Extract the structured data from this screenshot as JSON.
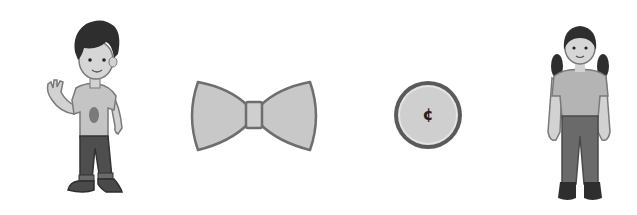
{
  "scene": {
    "background": "#ffffff",
    "items": [
      {
        "name": "boy",
        "description": "boy waving, t-shirt with oval emblem, dark pants, boots"
      },
      {
        "name": "bow-tie",
        "description": "gray bow tie"
      },
      {
        "name": "coin",
        "description": "coin",
        "symbol": "¢"
      },
      {
        "name": "girl",
        "description": "girl with pigtails, t-shirt, pants, dark shoes"
      }
    ]
  },
  "colors": {
    "outline": "#6e6e6e",
    "fill_light": "#c8c8c8",
    "skin": "#d2d2d2",
    "hair": "#2e2e2e",
    "pants": "#4e4e4e",
    "shoes": "#3a3a3a",
    "coin_rim": "#5a5a5a",
    "coin_face": "#cfcfcf"
  }
}
